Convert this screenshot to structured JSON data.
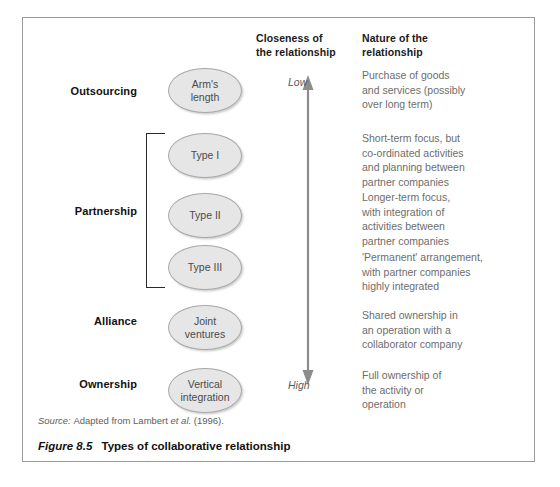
{
  "figure": {
    "number": "Figure 8.5",
    "title": "Types of collaborative relationship",
    "source_prefix": "Source:",
    "source_rest": "Adapted from Lambert",
    "source_italic": "et al.",
    "source_year": "(1996)."
  },
  "headers": {
    "closeness": "Closeness of\nthe relationship",
    "nature": "Nature of the\nrelationship"
  },
  "scale": {
    "low": "Low",
    "high": "High",
    "arrow_color": "#8c8c8c",
    "direction": "double-headed-vertical"
  },
  "colors": {
    "frame_border": "#9a9a9a",
    "oval_fill": "#e6e6e6",
    "oval_border": "#a8a8a8",
    "body_text": "#6d6d6d",
    "header_text": "#1a1a1a",
    "bracket": "#2a2a2a"
  },
  "rows": [
    {
      "stage": "Outsourcing",
      "oval": "Arm's\nlength",
      "description": "Purchase of goods\nand services (possibly\nover long term)"
    },
    {
      "stage": "",
      "oval": "Type I",
      "description": "Short-term focus, but\nco-ordinated activities\nand planning between\npartner companies"
    },
    {
      "stage": "Partnership",
      "oval": "Type II",
      "description": "Longer-term focus,\nwith integration of\nactivities between\npartner companies"
    },
    {
      "stage": "",
      "oval": "Type III",
      "description": "'Permanent' arrangement,\nwith partner companies\nhighly integrated"
    },
    {
      "stage": "Alliance",
      "oval": "Joint\nventures",
      "description": "Shared ownership in\nan operation with a\ncollaborator company"
    },
    {
      "stage": "Ownership",
      "oval": "Vertical\nintegration",
      "description": "Full ownership of\nthe activity or\noperation"
    }
  ]
}
